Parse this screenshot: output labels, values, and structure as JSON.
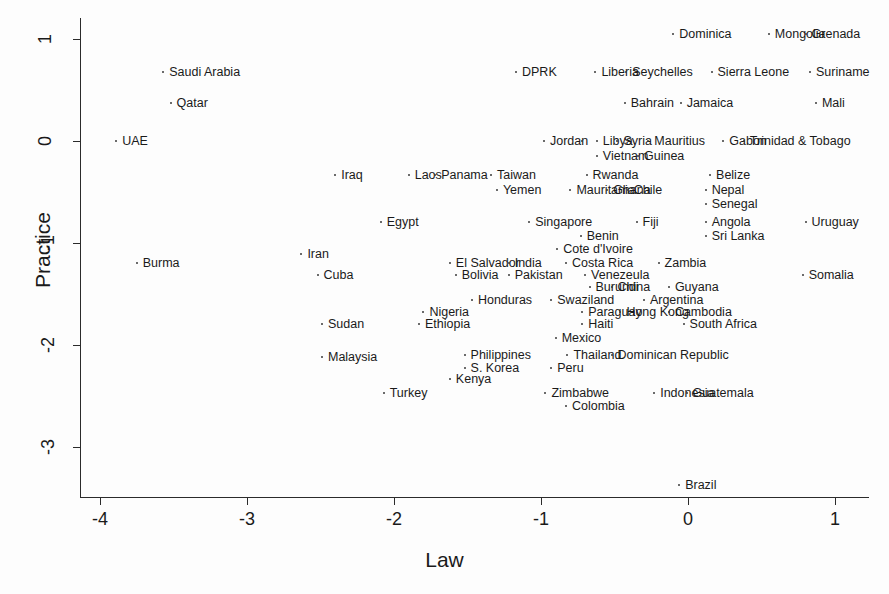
{
  "chart_data": {
    "type": "scatter",
    "title": "",
    "xlabel": "Law",
    "ylabel": "Practice",
    "xlim": [
      -4.25,
      1.2
    ],
    "ylim": [
      -3.55,
      1.25
    ],
    "xticks": [
      -4,
      -3,
      -2,
      -1,
      0,
      1
    ],
    "xtick_labels": [
      "-4",
      "-3",
      "-2",
      "-1",
      "0",
      "1"
    ],
    "yticks": [
      1,
      0,
      -1,
      -2,
      -3
    ],
    "ytick_labels": [
      "1",
      "0",
      "-1",
      "-2",
      "-3"
    ],
    "grid": false,
    "legend": "none",
    "marker_color": "#3a3a3a",
    "axis_color": "#2b2b2b",
    "points": [
      {
        "label": "Dominica",
        "x": -0.1,
        "y": 1.05
      },
      {
        "label": "Mongolia",
        "x": 0.55,
        "y": 1.05
      },
      {
        "label": "Grenada",
        "x": 0.8,
        "y": 1.05
      },
      {
        "label": "Saudi Arabia",
        "x": -3.57,
        "y": 0.68
      },
      {
        "label": "DPRK",
        "x": -1.17,
        "y": 0.68
      },
      {
        "label": "Liberia",
        "x": -0.63,
        "y": 0.68
      },
      {
        "label": "Seychelles",
        "x": -0.42,
        "y": 0.68
      },
      {
        "label": "Sierra Leone",
        "x": 0.16,
        "y": 0.68
      },
      {
        "label": "Suriname",
        "x": 0.83,
        "y": 0.68
      },
      {
        "label": "Qatar",
        "x": -3.52,
        "y": 0.37
      },
      {
        "label": "Bahrain",
        "x": -0.43,
        "y": 0.37
      },
      {
        "label": "Jamaica",
        "x": -0.05,
        "y": 0.37
      },
      {
        "label": "Mali",
        "x": 0.87,
        "y": 0.37
      },
      {
        "label": "UAE",
        "x": -3.89,
        "y": 0.0
      },
      {
        "label": "Jordan",
        "x": -0.98,
        "y": 0.0
      },
      {
        "label": "",
        "x": -0.72,
        "y": 0.0
      },
      {
        "label": "Libya",
        "x": -0.62,
        "y": 0.0
      },
      {
        "label": "Syria",
        "x": -0.48,
        "y": 0.0
      },
      {
        "label": "Mauritius",
        "x": -0.27,
        "y": 0.0
      },
      {
        "label": "Gabon",
        "x": 0.24,
        "y": 0.0
      },
      {
        "label": "Trinidad & Tobago",
        "x": 0.38,
        "y": 0.0
      },
      {
        "label": "Vietnam",
        "x": -0.62,
        "y": -0.15
      },
      {
        "label": "Guinea",
        "x": -0.34,
        "y": -0.15
      },
      {
        "label": "Iraq",
        "x": -2.4,
        "y": -0.33
      },
      {
        "label": "Laos",
        "x": -1.9,
        "y": -0.33
      },
      {
        "label": "Panama",
        "x": -1.72,
        "y": -0.33
      },
      {
        "label": "Taiwan",
        "x": -1.34,
        "y": -0.33
      },
      {
        "label": "Rwanda",
        "x": -0.69,
        "y": -0.33
      },
      {
        "label": "Belize",
        "x": 0.15,
        "y": -0.33
      },
      {
        "label": "Yemen",
        "x": -1.3,
        "y": -0.48
      },
      {
        "label": "Mauritania",
        "x": -0.8,
        "y": -0.48
      },
      {
        "label": "Ghana",
        "x": -0.55,
        "y": -0.48
      },
      {
        "label": "Chile",
        "x": -0.41,
        "y": -0.48
      },
      {
        "label": "Nepal",
        "x": 0.12,
        "y": -0.48
      },
      {
        "label": "Senegal",
        "x": 0.12,
        "y": -0.62
      },
      {
        "label": "Egypt",
        "x": -2.09,
        "y": -0.79
      },
      {
        "label": "Singapore",
        "x": -1.08,
        "y": -0.79
      },
      {
        "label": "Fiji",
        "x": -0.35,
        "y": -0.79
      },
      {
        "label": "Angola",
        "x": 0.12,
        "y": -0.79
      },
      {
        "label": "Uruguay",
        "x": 0.8,
        "y": -0.79
      },
      {
        "label": "Benin",
        "x": -0.73,
        "y": -0.93
      },
      {
        "label": "Sri Lanka",
        "x": 0.12,
        "y": -0.93
      },
      {
        "label": "Cote d'Ivoire",
        "x": -0.89,
        "y": -1.06
      },
      {
        "label": "Iran",
        "x": -2.63,
        "y": -1.11
      },
      {
        "label": "Burma",
        "x": -3.75,
        "y": -1.2
      },
      {
        "label": "El Salvador",
        "x": -1.62,
        "y": -1.2
      },
      {
        "label": "India",
        "x": -1.22,
        "y": -1.2
      },
      {
        "label": "Costa Rica",
        "x": -0.83,
        "y": -1.2
      },
      {
        "label": "Zambia",
        "x": -0.2,
        "y": -1.2
      },
      {
        "label": "Cuba",
        "x": -2.52,
        "y": -1.31
      },
      {
        "label": "Bolivia",
        "x": -1.58,
        "y": -1.31
      },
      {
        "label": "Pakistan",
        "x": -1.22,
        "y": -1.31
      },
      {
        "label": "Venezeula",
        "x": -0.7,
        "y": -1.31
      },
      {
        "label": "Somalia",
        "x": 0.78,
        "y": -1.31
      },
      {
        "label": "Burundi",
        "x": -0.67,
        "y": -1.43
      },
      {
        "label": "China",
        "x": -0.52,
        "y": -1.43
      },
      {
        "label": "Guyana",
        "x": -0.13,
        "y": -1.43
      },
      {
        "label": "Honduras",
        "x": -1.47,
        "y": -1.56
      },
      {
        "label": "Swaziland",
        "x": -0.93,
        "y": -1.56
      },
      {
        "label": "Argentina",
        "x": -0.3,
        "y": -1.56
      },
      {
        "label": "Nigeria",
        "x": -1.8,
        "y": -1.68
      },
      {
        "label": "Paraguay",
        "x": -0.72,
        "y": -1.68
      },
      {
        "label": "Hong Kong",
        "x": -0.46,
        "y": -1.68
      },
      {
        "label": "Cambodia",
        "x": -0.13,
        "y": -1.68
      },
      {
        "label": "Ethiopia",
        "x": -1.83,
        "y": -1.79
      },
      {
        "label": "Sudan",
        "x": -2.49,
        "y": -1.79
      },
      {
        "label": "Haiti",
        "x": -0.72,
        "y": -1.79
      },
      {
        "label": "South Africa",
        "x": -0.03,
        "y": -1.79
      },
      {
        "label": "Mexico",
        "x": -0.9,
        "y": -1.93
      },
      {
        "label": "Philippines",
        "x": -1.52,
        "y": -2.1
      },
      {
        "label": "Thailand",
        "x": -0.82,
        "y": -2.1
      },
      {
        "label": "Dominican Republic",
        "x": -0.52,
        "y": -2.1
      },
      {
        "label": "Malaysia",
        "x": -2.49,
        "y": -2.12
      },
      {
        "label": "S. Korea",
        "x": -1.52,
        "y": -2.23
      },
      {
        "label": "Peru",
        "x": -0.93,
        "y": -2.23
      },
      {
        "label": "Kenya",
        "x": -1.62,
        "y": -2.33
      },
      {
        "label": "Turkey",
        "x": -2.07,
        "y": -2.47
      },
      {
        "label": "Zimbabwe",
        "x": -0.97,
        "y": -2.47
      },
      {
        "label": "Indonesia",
        "x": -0.23,
        "y": -2.47
      },
      {
        "label": "Guatemala",
        "x": -0.01,
        "y": -2.47
      },
      {
        "label": "Colombia",
        "x": -0.83,
        "y": -2.6
      },
      {
        "label": "Brazil",
        "x": -0.06,
        "y": -3.37
      }
    ]
  },
  "axes": {
    "x_title": "Law",
    "y_title": "Practice"
  }
}
